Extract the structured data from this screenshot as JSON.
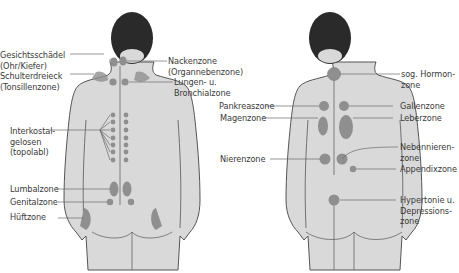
{
  "colors": {
    "skin": "#d9d9d9",
    "outline": "#555555",
    "hair": "#2a2a2a",
    "zone": "#8f8f8f",
    "zone_stroke": "#6e6e6e",
    "leader": "#6a6a6a",
    "text": "#3a3a3a"
  },
  "left_figure": {
    "title": "Back view with reflex zones (left)",
    "labels": [
      {
        "id": "gesichtsschaedel",
        "text": "Gesichtsschädel\n(Ohr/Kiefer)"
      },
      {
        "id": "schulterdreieck",
        "text": "Schulterdreieck\n(Tonsillenzone)"
      },
      {
        "id": "interkostal",
        "text": "Interkostal-\ngelosen\n(topolabl)"
      },
      {
        "id": "lumbalzone",
        "text": "Lumbalzone"
      },
      {
        "id": "genitalzone",
        "text": "Genitalzone"
      },
      {
        "id": "hueftzone",
        "text": "Hüftzone"
      },
      {
        "id": "nackenzone",
        "text": "Nackenzone\n(Organnebenzone)"
      },
      {
        "id": "lungen",
        "text": "Lungen- u.\nBronchialzone"
      }
    ]
  },
  "right_figure": {
    "title": "Back view with reflex zones (right)",
    "labels": [
      {
        "id": "hormonzone",
        "text": "sog. Hormon-\nzone"
      },
      {
        "id": "pankreaszone",
        "text": "Pankreaszone"
      },
      {
        "id": "magenzone",
        "text": "Magenzone"
      },
      {
        "id": "gallenzone",
        "text": "Gallenzone"
      },
      {
        "id": "leberzone",
        "text": "Leberzone"
      },
      {
        "id": "nierenzone",
        "text": "Nierenzone"
      },
      {
        "id": "nebennierenzone",
        "text": "Nebennieren-\nzone"
      },
      {
        "id": "appendixzone",
        "text": "Appendixzone"
      },
      {
        "id": "hypertonie",
        "text": "Hypertonie u.\nDepressions-\nzone"
      }
    ]
  }
}
